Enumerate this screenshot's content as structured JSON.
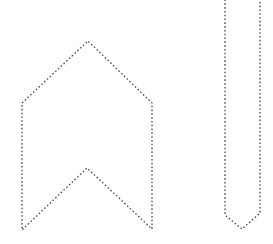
{
  "canvas": {
    "width": 273,
    "height": 244,
    "background": "#ffffff"
  },
  "style": {
    "stroke_color": "#555555",
    "stroke_style": "dotted"
  },
  "shapes": [
    {
      "name": "chevron-banner",
      "type": "polygon",
      "points": [
        [
          22,
          103
        ],
        [
          88,
          41
        ],
        [
          152,
          103
        ],
        [
          152,
          229
        ],
        [
          87,
          168
        ],
        [
          22,
          230
        ]
      ]
    },
    {
      "name": "vertical-strip-arrow",
      "type": "polygon",
      "points": [
        [
          225,
          -5
        ],
        [
          260,
          -5
        ],
        [
          260,
          213
        ],
        [
          242,
          229
        ],
        [
          225,
          215
        ]
      ]
    }
  ]
}
